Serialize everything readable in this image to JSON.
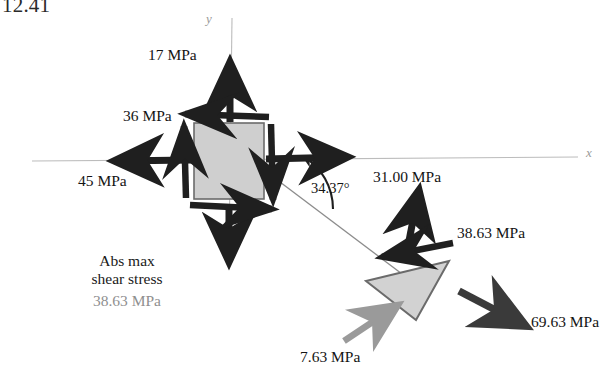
{
  "problem": {
    "number": "12.41"
  },
  "axes": {
    "x_label": "x",
    "y_label": "y",
    "color": "#b9b9b9"
  },
  "element": {
    "name": "stress-element-square",
    "fill": "#cfcfcf",
    "stroke": "#6b6b6b"
  },
  "plane": {
    "angle_label": "34.37°",
    "angle_value": 34.37,
    "incline_color": "#8c8c8c"
  },
  "square_stresses": [
    {
      "key": "normal_y",
      "label": "17 MPa",
      "value": 17,
      "unit": "MPa",
      "direction": "up",
      "kind": "normal"
    },
    {
      "key": "shear",
      "label": "36 MPa",
      "value": 36,
      "unit": "MPa",
      "direction": "left",
      "kind": "shear"
    },
    {
      "key": "normal_x",
      "label": "45 MPa",
      "value": 45,
      "unit": "MPa",
      "direction": "left",
      "kind": "normal"
    }
  ],
  "wedge_stresses": [
    {
      "key": "normal_incline",
      "label": "31.00 MPa",
      "value": 31.0,
      "unit": "MPa",
      "direction": "up",
      "kind": "normal",
      "color": "#1a1a1a"
    },
    {
      "key": "shear_incline",
      "label": "38.63 MPa",
      "value": 38.63,
      "unit": "MPa",
      "direction": "left",
      "kind": "shear",
      "color": "#1a1a1a"
    },
    {
      "key": "normal_face",
      "label": "69.63 MPa",
      "value": 69.63,
      "unit": "MPa",
      "direction": "down-right",
      "kind": "normal",
      "color": "#3a3a3a"
    },
    {
      "key": "normal_base",
      "label": "7.63 MPa",
      "value": 7.63,
      "unit": "MPa",
      "direction": "up-right",
      "kind": "normal",
      "color": "#9a9a9a"
    }
  ],
  "wedge": {
    "name": "stress-wedge-triangle",
    "fill": "#d2d2d2",
    "stroke": "#6b6b6b"
  },
  "annotation": {
    "title_line1": "Abs max",
    "title_line2": "shear stress",
    "value": "38.63 MPa",
    "value_color": "#8f8f8f"
  }
}
